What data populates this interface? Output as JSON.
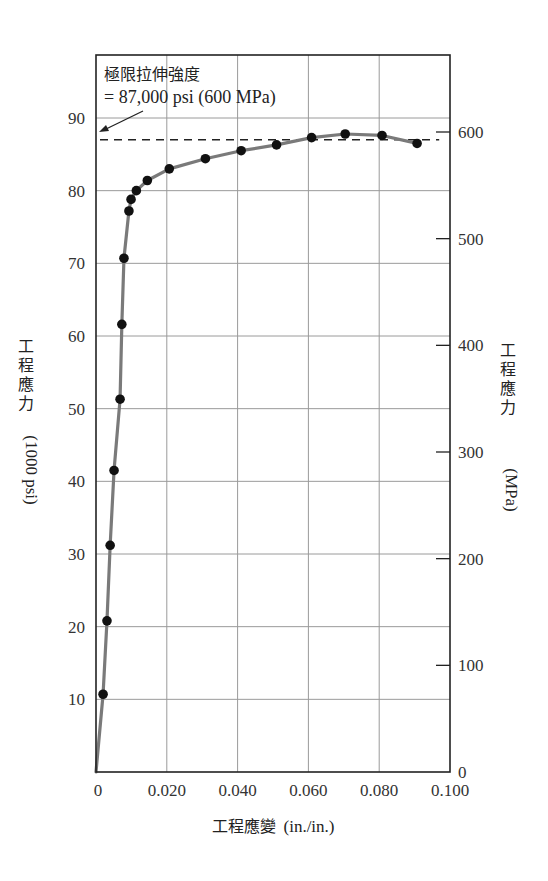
{
  "chart_data": {
    "type": "line",
    "title": "",
    "xlabel": "工程應變 (in./in.)",
    "xlabel_zh": "工程應變",
    "xlabel_unit": "(in./in.)",
    "ylabel": "工程應力 (1000 psi)",
    "ylabel_zh": "工程應力",
    "ylabel_unit": "(1000 psi)",
    "y2label": "工程應力 (MPa)",
    "y2label_zh": "工程應力",
    "y2label_unit": "(MPa)",
    "xlim": [
      0,
      0.1
    ],
    "ylim": [
      0,
      90
    ],
    "y2lim": [
      0,
      620
    ],
    "x_ticks": [
      "0",
      "0.020",
      "0.040",
      "0.060",
      "0.080",
      "0.100"
    ],
    "x_tick_values": [
      0,
      0.02,
      0.04,
      0.06,
      0.08,
      0.1
    ],
    "y_ticks": [
      "10",
      "20",
      "30",
      "40",
      "50",
      "60",
      "70",
      "80",
      "90"
    ],
    "y_tick_values": [
      10,
      20,
      30,
      40,
      50,
      60,
      70,
      80,
      90
    ],
    "y2_ticks": [
      "0",
      "100",
      "200",
      "300",
      "400",
      "500",
      "600"
    ],
    "y2_tick_values": [
      0,
      100,
      200,
      300,
      400,
      500,
      600
    ],
    "grid": true,
    "legend": null,
    "series": [
      {
        "name": "stress-strain",
        "style": "gray line with black markers",
        "x": [
          0.002,
          0.0031,
          0.004,
          0.0051,
          0.0068,
          0.0073,
          0.0079,
          0.0093,
          0.0099,
          0.0114,
          0.0145,
          0.0207,
          0.0309,
          0.041,
          0.051,
          0.0609,
          0.0704,
          0.0808,
          0.0907
        ],
        "y": [
          10.7,
          20.8,
          31.2,
          41.5,
          51.3,
          61.6,
          70.7,
          77.2,
          78.8,
          80.0,
          81.4,
          83.0,
          84.4,
          85.5,
          86.3,
          87.3,
          87.8,
          87.6,
          86.5
        ],
        "markers_at": [
          0.002,
          0.0031,
          0.004,
          0.0051,
          0.0068,
          0.0073,
          0.0079,
          0.0093,
          0.0099,
          0.0114,
          0.0145,
          0.0207,
          0.0309,
          0.041,
          0.051,
          0.0609,
          0.0704,
          0.0808,
          0.0907
        ]
      }
    ],
    "annotations": [
      {
        "text_zh": "極限拉伸強度",
        "text_value": "= 87,000 psi (600 MPa)",
        "points_to": {
          "x": 0.0,
          "y": 87
        },
        "reference_line": {
          "y": 87,
          "style": "dashed",
          "x_from": 0,
          "x_to": 0.08
        }
      }
    ],
    "colors": {
      "curve": "#7a7a7a",
      "marker": "#111111",
      "grid": "#9a9a9a",
      "axis": "#222222"
    }
  }
}
